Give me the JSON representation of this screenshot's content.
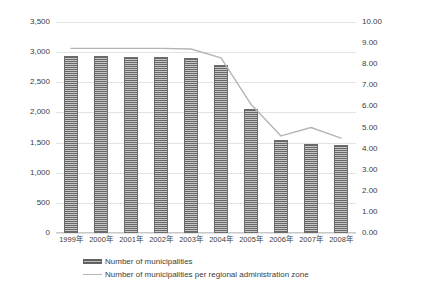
{
  "chart_data": {
    "type": "bar",
    "title": "",
    "xlabel": "",
    "ylabel": "",
    "grid": true,
    "legend_position": "bottom",
    "categories": [
      "1999年",
      "2000年",
      "2001年",
      "2002年",
      "2003年",
      "2004年",
      "2005年",
      "2006年",
      "2007年",
      "2008年"
    ],
    "y_left": {
      "label": "",
      "ylim": [
        0,
        3500
      ],
      "tick_step": 500,
      "ticks": [
        "0",
        "500",
        "1,000",
        "1,500",
        "2,000",
        "2,500",
        "3,000",
        "3,500"
      ],
      "tick_values": [
        0,
        500,
        1000,
        1500,
        2000,
        2500,
        3000,
        3500
      ]
    },
    "y_right": {
      "label": "",
      "ylim": [
        0,
        10
      ],
      "tick_step": 1,
      "ticks": [
        "0.00",
        "1.00",
        "2.00",
        "3.00",
        "4.00",
        "5.00",
        "6.00",
        "7.00",
        "8.00",
        "9.00",
        "10.00"
      ],
      "tick_values": [
        0,
        1,
        2,
        3,
        4,
        5,
        6,
        7,
        8,
        9,
        10
      ]
    },
    "series": [
      {
        "name": "Number of municipalities",
        "type": "bar",
        "axis": "left",
        "color": "#8d8d8d",
        "values": [
          2930,
          2930,
          2925,
          2920,
          2910,
          2790,
          2050,
          1540,
          1480,
          1460
        ]
      },
      {
        "name": "Number of municipalities per regional administration zone",
        "type": "line",
        "axis": "right",
        "color": "#b5b5b5",
        "values": [
          8.75,
          8.75,
          8.75,
          8.75,
          8.72,
          8.3,
          6.1,
          4.6,
          5.0,
          4.5
        ]
      }
    ],
    "legend": [
      {
        "label": "Number of municipalities",
        "marker": "bar-swatch"
      },
      {
        "label": "Number of municipalities per regional administration zone",
        "marker": "line-swatch"
      }
    ]
  }
}
